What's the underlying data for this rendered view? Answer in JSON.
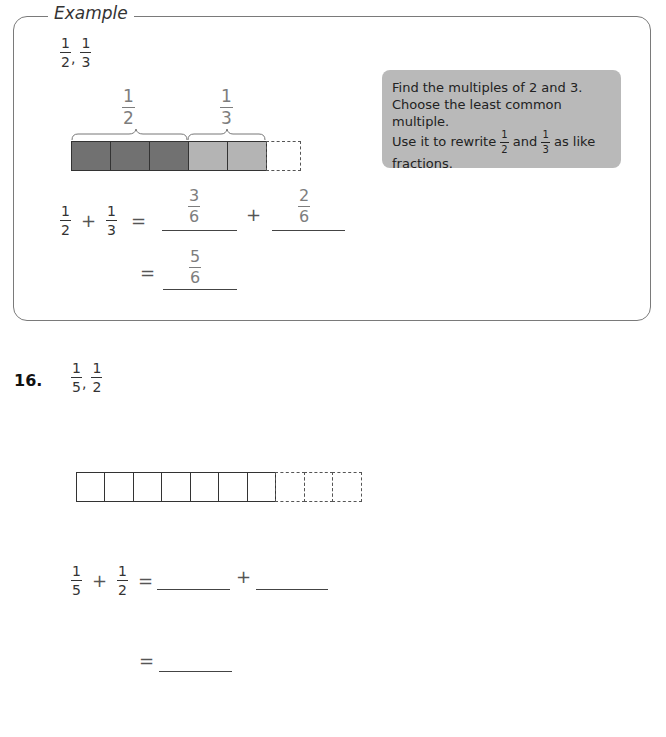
{
  "example": {
    "title": "Example",
    "given_fractions": [
      {
        "num": "1",
        "den": "2"
      },
      {
        "num": "1",
        "den": "3"
      }
    ],
    "given_separator": ",",
    "bar_labels": [
      {
        "num": "1",
        "den": "2"
      },
      {
        "num": "1",
        "den": "3"
      }
    ],
    "bar": {
      "cells": [
        "dark",
        "dark",
        "dark",
        "light",
        "light",
        "dashed"
      ],
      "colors": {
        "dark": "#717171",
        "light": "#b4b4b4"
      }
    },
    "equation1": {
      "lhs": [
        {
          "num": "1",
          "den": "2"
        },
        {
          "num": "1",
          "den": "3"
        }
      ],
      "plus": "+",
      "equals": "=",
      "answers": [
        {
          "num": "3",
          "den": "6"
        },
        {
          "num": "2",
          "den": "6"
        }
      ]
    },
    "equation2": {
      "equals": "=",
      "answer": {
        "num": "5",
        "den": "6"
      }
    },
    "hint": {
      "line1": "Find the multiples of 2 and 3.",
      "line2": "Choose the least common multiple.",
      "line3_pre": "Use it to rewrite",
      "frac_a": {
        "num": "1",
        "den": "2"
      },
      "line3_mid": "and",
      "frac_b": {
        "num": "1",
        "den": "3"
      },
      "line3_post": "as like",
      "line4": "fractions.",
      "background": "#b9b9b9"
    }
  },
  "problem16": {
    "number": "16.",
    "given_fractions": [
      {
        "num": "1",
        "den": "5"
      },
      {
        "num": "1",
        "den": "2"
      }
    ],
    "given_separator": ",",
    "bar": {
      "solid_cells": 7,
      "dashed_cells": 3
    },
    "equation1": {
      "lhs": [
        {
          "num": "1",
          "den": "5"
        },
        {
          "num": "1",
          "den": "2"
        }
      ],
      "plus": "+",
      "equals": "=",
      "blank_count": 2
    },
    "equation2": {
      "equals": "=",
      "blank_count": 1
    }
  }
}
